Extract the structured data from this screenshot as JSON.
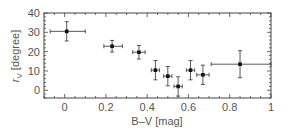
{
  "chart_data": {
    "type": "scatter",
    "title": "",
    "xlabel": "B–V [mag]",
    "ylabel_symbol": "r",
    "ylabel_subscript": "V",
    "ylabel_unit": " [degree]",
    "ylabel": "r_V [degree]",
    "xlim": [
      -0.1,
      1.0
    ],
    "ylim": [
      -4,
      40
    ],
    "xticks": [
      0,
      0.2,
      0.4,
      0.6,
      0.8,
      1
    ],
    "xtick_labels": [
      "0",
      "0.2",
      "0.4",
      "0.6",
      "0.8",
      "1"
    ],
    "yticks": [
      0,
      10,
      20,
      30,
      40
    ],
    "ytick_labels": [
      "0",
      "10",
      "20",
      "30",
      "40"
    ],
    "grid": false,
    "legend": null,
    "series": [
      {
        "name": "data",
        "points": [
          {
            "x": 0.01,
            "y": 30.5,
            "xerr": [
              0.08,
              0.09
            ],
            "yerr": 5
          },
          {
            "x": 0.23,
            "y": 22.8,
            "xerr": [
              0.04,
              0.05
            ],
            "yerr": 3
          },
          {
            "x": 0.36,
            "y": 19.7,
            "xerr": [
              0.03,
              0.03
            ],
            "yerr": 3.5
          },
          {
            "x": 0.44,
            "y": 10.4,
            "xerr": [
              0.02,
              0.02
            ],
            "yerr": 5
          },
          {
            "x": 0.5,
            "y": 7.3,
            "xerr": [
              0.02,
              0.02
            ],
            "yerr": 5
          },
          {
            "x": 0.55,
            "y": 2.0,
            "xerr": [
              0.02,
              0.02
            ],
            "yerr": 5
          },
          {
            "x": 0.61,
            "y": 10.4,
            "xerr": [
              0.02,
              0.02
            ],
            "yerr": 5
          },
          {
            "x": 0.67,
            "y": 8.0,
            "xerr": [
              0.03,
              0.03
            ],
            "yerr": 5
          },
          {
            "x": 0.85,
            "y": 13.5,
            "xerr": [
              0.14,
              0.15
            ],
            "yerr": 7
          }
        ]
      }
    ]
  }
}
